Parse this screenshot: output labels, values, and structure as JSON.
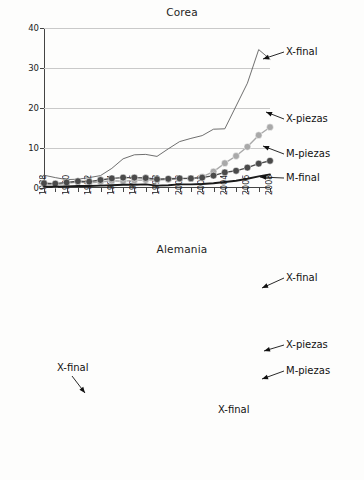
{
  "chart_data": [
    {
      "type": "line",
      "title": "Corea",
      "xlabel": "",
      "ylabel": "",
      "xlim": [
        1988,
        2008
      ],
      "ylim": [
        0,
        40
      ],
      "yticks": [
        0,
        10,
        20,
        30,
        40
      ],
      "grid": true,
      "legend_position": "right-inline-labels",
      "x": [
        1988,
        1989,
        1990,
        1991,
        1992,
        1993,
        1994,
        1995,
        1996,
        1997,
        1998,
        1999,
        2000,
        2001,
        2002,
        2003,
        2004,
        2005,
        2006,
        2007,
        2008
      ],
      "xtick_labels": [
        "1988",
        "1990",
        "1992",
        "1994",
        "1996",
        "1998",
        "2000",
        "2002",
        "2004",
        "2006",
        "2008"
      ],
      "series": [
        {
          "name": "X-final",
          "style": "thin-line",
          "color": "#555555",
          "values": [
            3.2,
            2.6,
            2.1,
            2.2,
            2.6,
            3.1,
            4.9,
            7.3,
            8.3,
            8.4,
            7.9,
            9.8,
            11.6,
            12.4,
            13.1,
            14.7,
            14.8,
            20.5,
            26.2,
            34.6,
            32.2
          ]
        },
        {
          "name": "X-piezas",
          "style": "marker-line-light",
          "color": "#a9a9a9",
          "values": [
            0.9,
            0.8,
            1.2,
            1.5,
            1.3,
            1.5,
            1.8,
            1.7,
            1.9,
            2.0,
            2.0,
            2.1,
            2.3,
            2.4,
            2.8,
            4.1,
            6.2,
            8.0,
            10.3,
            13.2,
            15.2
          ]
        },
        {
          "name": "M-piezas",
          "style": "marker-line-dark",
          "color": "#4a4a4a",
          "values": [
            1.2,
            1.1,
            1.4,
            1.7,
            1.6,
            2.0,
            2.4,
            2.6,
            2.6,
            2.5,
            2.2,
            2.3,
            2.4,
            2.4,
            2.6,
            3.1,
            3.9,
            4.3,
            5.1,
            6.1,
            6.8
          ]
        },
        {
          "name": "M-final",
          "style": "thick-line",
          "color": "#1a1a1a",
          "values": [
            0.3,
            0.3,
            0.4,
            0.5,
            0.5,
            0.6,
            0.7,
            0.8,
            0.8,
            0.9,
            0.6,
            0.7,
            0.9,
            0.9,
            1.0,
            1.2,
            1.5,
            1.8,
            2.3,
            2.9,
            3.4
          ]
        }
      ],
      "annotations": [
        {
          "text": "X-final",
          "target_series": "X-final"
        },
        {
          "text": "X-piezas",
          "target_series": "X-piezas"
        },
        {
          "text": "M-piezas",
          "target_series": "M-piezas"
        },
        {
          "text": "M-final",
          "target_series": "M-final"
        }
      ]
    },
    {
      "type": "line",
      "title": "Alemania",
      "xlabel": "",
      "ylabel": "",
      "xlim": [
        1988,
        2008
      ],
      "ylim": [
        0,
        200
      ],
      "yticks": [
        0,
        50,
        100,
        150,
        200
      ],
      "grid": true,
      "legend_position": "right-inline-labels",
      "x": [
        1988,
        1989,
        1990,
        1991,
        1992,
        1993,
        1994,
        1995,
        1996,
        1997,
        1998,
        1999,
        2000,
        2001,
        2002,
        2003,
        2004,
        2005,
        2006,
        2007,
        2008
      ],
      "xtick_labels": [
        "1988",
        "1990",
        "1992",
        "1994",
        "1996",
        "1998",
        "2000",
        "2002",
        "2004",
        "2006",
        "2008"
      ],
      "series": [
        {
          "name": "X-final (thin)",
          "style": "thin-line",
          "color": "#555555",
          "values": [
            37,
            44,
            45,
            42,
            53,
            40,
            48,
            60,
            62,
            61,
            74,
            73,
            77,
            86,
            98,
            124,
            126,
            138,
            168,
            170,
            182
          ]
        },
        {
          "name": "X-piezas",
          "style": "marker-line-light",
          "color": "#a9a9a9",
          "values": [
            18,
            17,
            22,
            23,
            21,
            19,
            26,
            32,
            33,
            34,
            36,
            36,
            35,
            37,
            43,
            49,
            60,
            63,
            69,
            83,
            85
          ]
        },
        {
          "name": "M-piezas",
          "style": "marker-line-dark",
          "color": "#4a4a4a",
          "values": [
            10,
            10,
            13,
            16,
            15,
            10,
            12,
            14,
            17,
            18,
            20,
            21,
            21,
            22,
            24,
            29,
            34,
            40,
            48,
            52,
            55
          ]
        },
        {
          "name": "X-final (thick)",
          "style": "thick-line",
          "color": "#1a1a1a",
          "values": [
            12,
            15,
            22,
            28,
            27,
            21,
            23,
            29,
            30,
            29,
            25,
            26,
            29,
            32,
            36,
            40,
            44,
            48,
            51,
            53,
            55
          ]
        }
      ],
      "annotations": [
        {
          "text": "X-final",
          "target_series": "X-final (thin)"
        },
        {
          "text": "X-piezas",
          "target_series": "X-piezas"
        },
        {
          "text": "M-piezas",
          "target_series": "M-piezas"
        },
        {
          "text": "X-final",
          "target_series": "X-final (thick)"
        }
      ]
    }
  ],
  "charts": {
    "corea": {
      "title": "Corea",
      "yticks": [
        "0",
        "10",
        "20",
        "30",
        "40"
      ],
      "xlabels": [
        "1988",
        "1990",
        "1992",
        "1994",
        "1996",
        "1998",
        "2000",
        "2002",
        "2004",
        "2006",
        "2008"
      ],
      "callouts": {
        "xfinal": "X-final",
        "xpiezas": "X-piezas",
        "mpiezas": "M-piezas",
        "mfinal": "M-final"
      }
    },
    "alemania": {
      "title": "Alemania",
      "yticks": [
        "0",
        "50",
        "100",
        "150",
        "200"
      ],
      "xlabels": [
        "1988",
        "1990",
        "1992",
        "1994",
        "1996",
        "1998",
        "2000",
        "2002",
        "2004",
        "2006",
        "2008"
      ],
      "callouts": {
        "xfinal_right": "X-final",
        "xpiezas": "X-piezas",
        "mpiezas": "M-piezas",
        "xfinal_left": "X-final",
        "xfinal_inline": "X-final"
      }
    }
  },
  "colors": {
    "thin_line": "#555555",
    "thick_line": "#1a1a1a",
    "marker_light": "#a9a9a9",
    "marker_dark": "#4a4a4a",
    "grid": "#c9c9c9",
    "axis": "#444444"
  }
}
